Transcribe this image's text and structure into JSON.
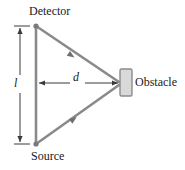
{
  "figure": {
    "name": "light-scattering-detector-obstacle-diagram",
    "background_color": "#ffffff",
    "line_color": "#808080",
    "dim_line_color": "#3a3a3a",
    "text_color": "#1a1a1a",
    "obstacle_fill": "#d9d9d9",
    "obstacle_stroke": "#8c8c8c",
    "labels": {
      "detector": "Detector",
      "source": "Source",
      "obstacle": "Obstacle",
      "length": "l",
      "distance": "d"
    },
    "geometry": {
      "detector_vertex": [
        36,
        26
      ],
      "source_vertex": [
        36,
        144
      ],
      "obstacle_vertex": [
        120,
        83
      ],
      "obstacle_rect": [
        120,
        69,
        12,
        27
      ],
      "length_dim_x": 20,
      "length_dim_top_y": 26,
      "length_dim_bottom_y": 144,
      "distance_dim_y": 83,
      "distance_dim_left_x": 38,
      "distance_dim_right_x": 119
    }
  }
}
